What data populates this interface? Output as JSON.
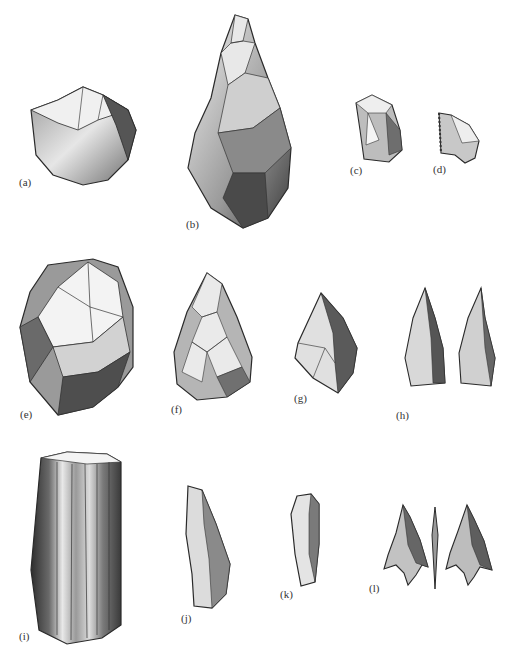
{
  "figure": {
    "kind": "stone-tool-illustration",
    "colors": {
      "outline": "#2a2a2a",
      "dark": "#4a4a4a",
      "mid": "#8c8c8c",
      "light": "#d6d6d6",
      "paper": "#ffffff"
    },
    "items": [
      {
        "id": "a",
        "label": "(a)",
        "description": "pebble chopper"
      },
      {
        "id": "b",
        "label": "(b)",
        "description": "hand axe"
      },
      {
        "id": "c",
        "label": "(c)",
        "description": "flake tool"
      },
      {
        "id": "d",
        "label": "(d)",
        "description": "small flake"
      },
      {
        "id": "e",
        "label": "(e)",
        "description": "prepared core"
      },
      {
        "id": "f",
        "label": "(f)",
        "description": "bifacial point"
      },
      {
        "id": "g",
        "label": "(g)",
        "description": "retouched point"
      },
      {
        "id": "h",
        "label": "(h)",
        "description": "pair of points"
      },
      {
        "id": "i",
        "label": "(i)",
        "description": "blade core"
      },
      {
        "id": "j",
        "label": "(j)",
        "description": "blade"
      },
      {
        "id": "k",
        "label": "(k)",
        "description": "end scraper"
      },
      {
        "id": "l",
        "label": "(l)",
        "description": "barbed arrowhead (two faces and profile)"
      }
    ]
  }
}
